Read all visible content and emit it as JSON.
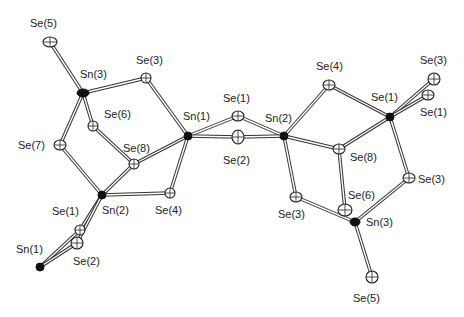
{
  "diagram": {
    "type": "ORTEP crystal structure",
    "atoms": [
      {
        "id": "se5_l",
        "label": "Se(5)",
        "el": "Se",
        "x": 50,
        "y": 42,
        "rx": 7,
        "ry": 5,
        "lx": 30,
        "ly": 27
      },
      {
        "id": "sn3_l",
        "label": "Sn(3)",
        "el": "Sn",
        "x": 83,
        "y": 93,
        "rx": 6,
        "ry": 4,
        "lx": 80,
        "ly": 78
      },
      {
        "id": "se3_l",
        "label": "Se(3)",
        "el": "Se",
        "x": 146,
        "y": 78,
        "rx": 5,
        "ry": 5,
        "lx": 136,
        "ly": 64
      },
      {
        "id": "se6_l",
        "label": "Se(6)",
        "el": "Se",
        "x": 93,
        "y": 126,
        "rx": 5,
        "ry": 5,
        "lx": 104,
        "ly": 118
      },
      {
        "id": "se7_l",
        "label": "Se(7)",
        "el": "Se",
        "x": 60,
        "y": 145,
        "rx": 6,
        "ry": 5,
        "lx": 18,
        "ly": 149
      },
      {
        "id": "sn1_c",
        "label": "Sn(1)",
        "el": "Sn",
        "x": 188,
        "y": 136,
        "rx": 4,
        "ry": 4,
        "lx": 183,
        "ly": 120
      },
      {
        "id": "se8_l",
        "label": "Se(8)",
        "el": "Se",
        "x": 134,
        "y": 164,
        "rx": 5,
        "ry": 5,
        "lx": 123,
        "ly": 152
      },
      {
        "id": "sn2_l",
        "label": "Sn(2)",
        "el": "Sn",
        "x": 102,
        "y": 195,
        "rx": 4,
        "ry": 4,
        "lx": 102,
        "ly": 214
      },
      {
        "id": "se4_l",
        "label": "Se(4)",
        "el": "Se",
        "x": 170,
        "y": 193,
        "rx": 5,
        "ry": 5,
        "lx": 155,
        "ly": 214
      },
      {
        "id": "se1_ll",
        "label": "Se(1)",
        "el": "Se",
        "x": 80,
        "y": 230,
        "rx": 5,
        "ry": 5,
        "lx": 52,
        "ly": 215
      },
      {
        "id": "se2_ll",
        "label": "Se(2)",
        "el": "Se",
        "x": 77,
        "y": 243,
        "rx": 6,
        "ry": 6,
        "lx": 73,
        "ly": 265
      },
      {
        "id": "sn1_ll",
        "label": "Sn(1)",
        "el": "Sn",
        "x": 40,
        "y": 267,
        "rx": 4,
        "ry": 4,
        "lx": 16,
        "ly": 253
      },
      {
        "id": "se1_c",
        "label": "Se(1)",
        "el": "Se",
        "x": 238,
        "y": 116,
        "rx": 6,
        "ry": 5,
        "lx": 223,
        "ly": 102
      },
      {
        "id": "se2_c",
        "label": "Se(2)",
        "el": "Se",
        "x": 238,
        "y": 137,
        "rx": 6,
        "ry": 7,
        "lx": 223,
        "ly": 164
      },
      {
        "id": "sn2_c",
        "label": "Sn(2)",
        "el": "Sn",
        "x": 284,
        "y": 136,
        "rx": 4,
        "ry": 4,
        "lx": 265,
        "ly": 122
      },
      {
        "id": "se4_r",
        "label": "Se(4)",
        "el": "Se",
        "x": 329,
        "y": 85,
        "rx": 6,
        "ry": 5,
        "lx": 316,
        "ly": 70
      },
      {
        "id": "se1_rm",
        "label": "Se(1)",
        "el": "Sn",
        "x": 390,
        "y": 117,
        "rx": 4,
        "ry": 4,
        "lx": 371,
        "ly": 101
      },
      {
        "id": "se3_rt",
        "label": "Se(3)",
        "el": "Se",
        "x": 434,
        "y": 79,
        "rx": 6,
        "ry": 6,
        "lx": 420,
        "ly": 64
      },
      {
        "id": "se1_rt",
        "label": "Se(1)",
        "el": "Se",
        "x": 428,
        "y": 95,
        "rx": 6,
        "ry": 5,
        "lx": 420,
        "ly": 116
      },
      {
        "id": "se8_r",
        "label": "Se(8)",
        "el": "Se",
        "x": 339,
        "y": 149,
        "rx": 6,
        "ry": 5,
        "lx": 350,
        "ly": 161
      },
      {
        "id": "se3_r",
        "label": "Se(3)",
        "el": "Se",
        "x": 296,
        "y": 197,
        "rx": 6,
        "ry": 5,
        "lx": 278,
        "ly": 218
      },
      {
        "id": "se6_r",
        "label": "Se(6)",
        "el": "Se",
        "x": 345,
        "y": 210,
        "rx": 7,
        "ry": 6,
        "lx": 348,
        "ly": 199
      },
      {
        "id": "sn3_r",
        "label": "Sn(3)",
        "el": "Sn",
        "x": 355,
        "y": 222,
        "rx": 5,
        "ry": 4,
        "lx": 366,
        "ly": 226
      },
      {
        "id": "se3_r2",
        "label": "Se(3)",
        "el": "Se",
        "x": 409,
        "y": 178,
        "rx": 6,
        "ry": 5,
        "lx": 418,
        "ly": 183
      },
      {
        "id": "se5_r",
        "label": "Se(5)",
        "el": "Se",
        "x": 372,
        "y": 277,
        "rx": 6,
        "ry": 6,
        "lx": 353,
        "ly": 302
      }
    ],
    "labels": [
      "Se(5)",
      "Sn(3)",
      "Se(3)",
      "Se(6)",
      "Se(7)",
      "Sn(1)",
      "Se(8)",
      "Sn(2)",
      "Se(4)",
      "Se(1)",
      "Se(2)",
      "Sn(1)",
      "Se(1)",
      "Se(2)",
      "Sn(2)",
      "Se(4)",
      "Se(1)",
      "Se(3)",
      "Se(1)",
      "Se(8)",
      "Se(3)",
      "Se(6)",
      "Sn(3)",
      "Se(3)",
      "Se(5)"
    ],
    "bonds": [
      [
        "se5_l",
        "sn3_l"
      ],
      [
        "sn3_l",
        "se3_l"
      ],
      [
        "sn3_l",
        "se6_l"
      ],
      [
        "sn3_l",
        "se7_l"
      ],
      [
        "se3_l",
        "sn1_c"
      ],
      [
        "se6_l",
        "se8_l"
      ],
      [
        "se7_l",
        "sn2_l"
      ],
      [
        "se8_l",
        "sn1_c"
      ],
      [
        "se8_l",
        "sn2_l"
      ],
      [
        "sn2_l",
        "se4_l"
      ],
      [
        "se4_l",
        "sn1_c"
      ],
      [
        "sn2_l",
        "se1_ll"
      ],
      [
        "sn2_l",
        "se2_ll"
      ],
      [
        "se1_ll",
        "sn1_ll"
      ],
      [
        "se2_ll",
        "sn1_ll"
      ],
      [
        "sn1_c",
        "se1_c"
      ],
      [
        "sn1_c",
        "se2_c"
      ],
      [
        "se1_c",
        "sn2_c"
      ],
      [
        "se2_c",
        "sn2_c"
      ],
      [
        "sn2_c",
        "se4_r"
      ],
      [
        "sn2_c",
        "se8_r"
      ],
      [
        "sn2_c",
        "se3_r"
      ],
      [
        "se4_r",
        "se1_rm"
      ],
      [
        "se8_r",
        "se1_rm"
      ],
      [
        "se1_rm",
        "se3_rt"
      ],
      [
        "se1_rm",
        "se1_rt"
      ],
      [
        "se1_rm",
        "se3_r2"
      ],
      [
        "se8_r",
        "se6_r"
      ],
      [
        "se3_r",
        "sn3_r"
      ],
      [
        "se3_r2",
        "sn3_r"
      ],
      [
        "sn3_r",
        "se5_r"
      ]
    ]
  }
}
